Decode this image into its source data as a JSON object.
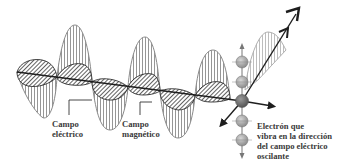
{
  "diagram": {
    "labels": {
      "electric_field": {
        "line1": "Campo",
        "line2": "eléctrico"
      },
      "magnetic_field": {
        "line1": "Campo",
        "line2": "magnético"
      },
      "electron": {
        "line1": "Electrón que",
        "line2": "vibra en la dirección",
        "line3": "del campo eléctrico",
        "line4": "oscilante"
      }
    },
    "elements": [
      "electric-field-wave",
      "magnetic-field-wave",
      "propagation-axis",
      "electron-oscillation-column",
      "direction-arrows"
    ],
    "colors": {
      "electric_wave_stroke": "#8a8a8a",
      "magnetic_wave_fill": "#6a6a6a",
      "axis": "#1e1e1e",
      "electron_fill": "#a8a8a8",
      "electron_center_fill": "#6e6e6e",
      "text": "#3a3a3a"
    }
  }
}
